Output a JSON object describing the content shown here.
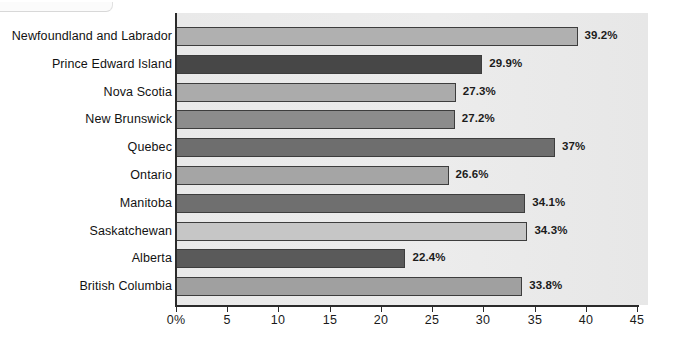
{
  "chart_data": {
    "type": "bar",
    "orientation": "horizontal",
    "title": "",
    "xlabel": "",
    "ylabel": "",
    "xlim": [
      0,
      45
    ],
    "grid": false,
    "legend": "none",
    "xticks": [
      "0%",
      "5",
      "10",
      "15",
      "20",
      "25",
      "30",
      "35",
      "40",
      "45"
    ],
    "xtick_values": [
      0,
      5,
      10,
      15,
      20,
      25,
      30,
      35,
      40,
      45
    ],
    "categories": [
      "Newfoundland and Labrador",
      "Prince Edward Island",
      "Nova Scotia",
      "New Brunswick",
      "Quebec",
      "Ontario",
      "Manitoba",
      "Saskatchewan",
      "Alberta",
      "British Columbia"
    ],
    "values": [
      39.2,
      29.9,
      27.3,
      27.2,
      37,
      26.6,
      34.1,
      34.3,
      22.4,
      33.8
    ],
    "data_labels": [
      "39.2%",
      "29.9%",
      "27.3%",
      "27.2%",
      "37%",
      "26.6%",
      "34.1%",
      "34.3%",
      "22.4%",
      "33.8%"
    ],
    "bar_colors": [
      "#b0b0b0",
      "#474747",
      "#ababab",
      "#8c8c8c",
      "#6e6e6e",
      "#a5a5a5",
      "#6f6f6f",
      "#c6c6c6",
      "#5a5a5a",
      "#a0a0a0"
    ]
  },
  "style": {
    "plot_background": "#ebebeb",
    "axis_color": "#2b2b2b",
    "label_color": "#121212",
    "value_color": "#1c1c1c"
  }
}
